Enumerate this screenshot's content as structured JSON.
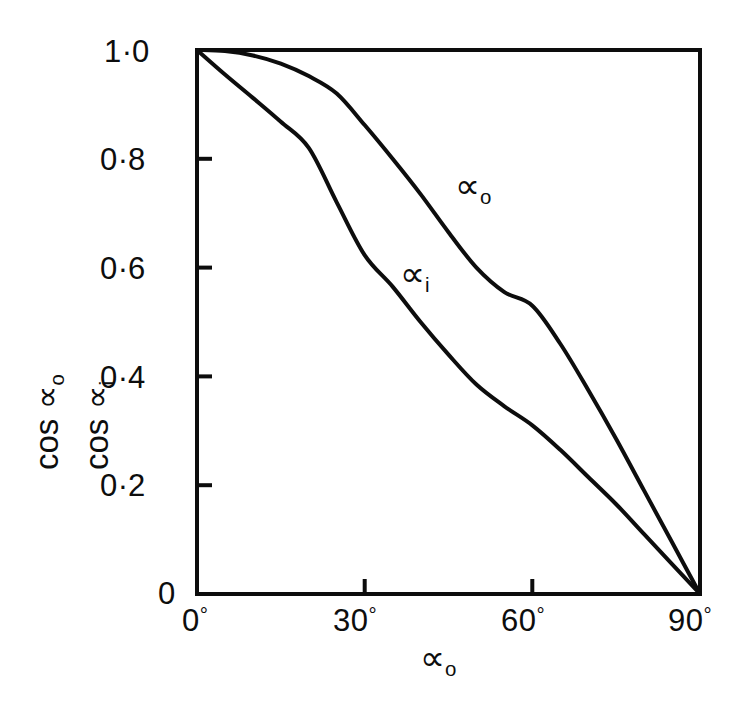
{
  "figure": {
    "kind": "line-plot",
    "background_color": "#ffffff",
    "line_color": "#0d0d0d"
  },
  "axes": {
    "y": {
      "title_line1": "cos ∝",
      "title_line1_sub": "o",
      "title_line2": "cos ∝",
      "title_line2_sub": "i",
      "ticks": [
        {
          "label_int": "1",
          "label_dec": "0",
          "value": 1.0
        },
        {
          "label_int": "0",
          "label_dec": "8",
          "value": 0.8
        },
        {
          "label_int": "0",
          "label_dec": "6",
          "value": 0.6
        },
        {
          "label_int": "0",
          "label_dec": "4",
          "value": 0.4
        },
        {
          "label_int": "0",
          "label_dec": "2",
          "value": 0.2
        },
        {
          "label_int": "0",
          "label_dec": "",
          "value": 0.0
        }
      ]
    },
    "x": {
      "title": "∝",
      "title_sub": "o",
      "ticks": [
        {
          "label": "0",
          "degree": "°",
          "value": 0
        },
        {
          "label": "30",
          "degree": "°",
          "value": 30
        },
        {
          "label": "60",
          "degree": "°",
          "value": 60
        },
        {
          "label": "90",
          "degree": "°",
          "value": 90
        }
      ]
    }
  },
  "curve_labels": {
    "upper": {
      "base": "∝",
      "sub": "o"
    },
    "lower": {
      "base": "∝",
      "sub": "i"
    }
  },
  "chart_data": {
    "type": "line",
    "title": "",
    "subtitle": "",
    "xlabel": "∝o",
    "ylabel": "cos ∝o   cos ∝i",
    "xlim": [
      0,
      90
    ],
    "ylim": [
      0,
      1.0
    ],
    "xticks": [
      0,
      30,
      60,
      90
    ],
    "xticklabels": [
      "0°",
      "30°",
      "60°",
      "90°"
    ],
    "yticks": [
      0,
      0.2,
      0.4,
      0.6,
      0.8,
      1.0
    ],
    "yticklabels": [
      "0",
      "0·2",
      "0·4",
      "0·6",
      "0·8",
      "1·0"
    ],
    "grid": false,
    "legend": "inline-annotations",
    "annotations": [
      {
        "text": "∝o",
        "x": 52,
        "y": 0.72
      },
      {
        "text": "∝i",
        "x": 38,
        "y": 0.58
      }
    ],
    "series": [
      {
        "name": "∝o",
        "x": [
          0,
          5,
          10,
          15,
          20,
          25,
          30,
          35,
          40,
          45,
          50,
          55,
          60,
          65,
          70,
          75,
          80,
          85,
          90
        ],
        "values": [
          1.0,
          0.998,
          0.99,
          0.975,
          0.952,
          0.92,
          0.862,
          0.8,
          0.735,
          0.665,
          0.6,
          0.555,
          0.53,
          0.46,
          0.375,
          0.285,
          0.19,
          0.095,
          0.0
        ]
      },
      {
        "name": "∝i",
        "x": [
          0,
          5,
          10,
          15,
          20,
          25,
          30,
          35,
          40,
          45,
          50,
          55,
          60,
          65,
          70,
          75,
          80,
          85,
          90
        ],
        "values": [
          1.0,
          0.955,
          0.912,
          0.868,
          0.82,
          0.72,
          0.623,
          0.565,
          0.5,
          0.44,
          0.385,
          0.345,
          0.31,
          0.265,
          0.215,
          0.165,
          0.11,
          0.055,
          0.0
        ]
      }
    ]
  }
}
